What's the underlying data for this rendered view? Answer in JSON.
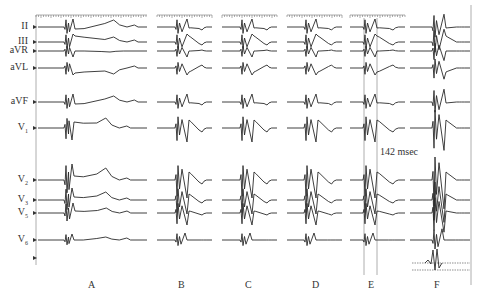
{
  "figure": {
    "leads": [
      {
        "id": "II",
        "label": "II",
        "y": 27
      },
      {
        "id": "III",
        "label": "III",
        "y": 42
      },
      {
        "id": "aVR",
        "label": "aVR",
        "y": 51
      },
      {
        "id": "aVL",
        "label": "aVL",
        "y": 68
      },
      {
        "id": "aVF",
        "label": "aVF",
        "y": 102
      },
      {
        "id": "V1",
        "label": "V",
        "sub": "1",
        "y": 128
      },
      {
        "id": "V2",
        "label": "V",
        "sub": "2",
        "y": 180
      },
      {
        "id": "V3",
        "label": "V",
        "sub": "3",
        "y": 200
      },
      {
        "id": "V5",
        "label": "V",
        "sub": "5",
        "y": 213
      },
      {
        "id": "V6",
        "label": "V",
        "sub": "6",
        "y": 240
      }
    ],
    "panels": [
      {
        "id": "A",
        "label": "A",
        "x0": 36,
        "x1": 147,
        "label_x": 88
      },
      {
        "id": "B",
        "label": "B",
        "x0": 157,
        "x1": 212,
        "label_x": 178
      },
      {
        "id": "C",
        "label": "C",
        "x0": 222,
        "x1": 277,
        "label_x": 245
      },
      {
        "id": "D",
        "label": "D",
        "x0": 287,
        "x1": 342,
        "label_x": 312
      },
      {
        "id": "E",
        "label": "E",
        "x0": 350,
        "x1": 405,
        "label_x": 368
      },
      {
        "id": "F",
        "label": "F",
        "x0": 410,
        "x1": 470,
        "label_x": 434
      }
    ],
    "annotation": {
      "text": "142 msec",
      "x": 380,
      "y": 146
    },
    "interval_lines_E": [
      364,
      377
    ],
    "colors": {
      "trace": "#2a2a2a",
      "guide": "#9a9a9a",
      "background": "#ffffff"
    }
  }
}
